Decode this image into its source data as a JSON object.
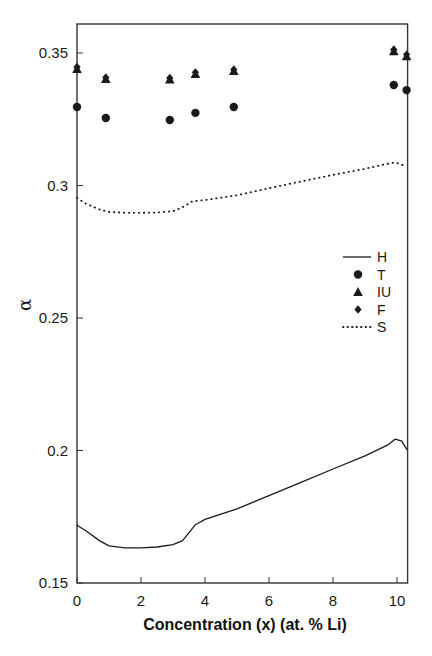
{
  "chart_data": {
    "type": "line",
    "title": "",
    "xlabel": "Concentration (x) (at. % Li)",
    "ylabel": "α",
    "xlim": [
      0,
      10.3
    ],
    "ylim": [
      0.15,
      0.36
    ],
    "xticks": [
      0,
      2,
      4,
      6,
      8,
      10
    ],
    "xtick_labels": [
      "0",
      "2",
      "4",
      "6",
      "8",
      "10"
    ],
    "yticks": [
      0.15,
      0.2,
      0.25,
      0.3,
      0.35
    ],
    "ytick_labels": [
      "0.15",
      "0.2",
      "0.25",
      "0.3",
      "0.35"
    ],
    "grid": false,
    "legend_position": "center-right",
    "series": [
      {
        "name": "H",
        "style": "solid-line",
        "x": [
          0,
          0.3,
          0.7,
          1.0,
          1.5,
          2.0,
          2.5,
          3.0,
          3.3,
          3.5,
          3.7,
          4.0,
          4.5,
          5.0,
          6.0,
          7.0,
          8.0,
          9.0,
          9.7,
          9.95,
          10.15,
          10.3
        ],
        "y": [
          0.1718,
          0.1695,
          0.166,
          0.164,
          0.1633,
          0.1633,
          0.1636,
          0.1645,
          0.166,
          0.169,
          0.172,
          0.174,
          0.176,
          0.178,
          0.183,
          0.188,
          0.193,
          0.198,
          0.202,
          0.2043,
          0.2035,
          0.2005
        ]
      },
      {
        "name": "T",
        "style": "circle-marker",
        "x": [
          0,
          0.9,
          2.9,
          3.7,
          4.9,
          9.9,
          10.3
        ],
        "y": [
          0.3296,
          0.3255,
          0.3247,
          0.3274,
          0.3296,
          0.3379,
          0.336
        ]
      },
      {
        "name": "IU",
        "style": "triangle-marker",
        "x": [
          0,
          0.9,
          2.9,
          3.7,
          4.9,
          9.9,
          10.3
        ],
        "y": [
          0.344,
          0.3402,
          0.34,
          0.3421,
          0.3432,
          0.3507,
          0.3488
        ]
      },
      {
        "name": "F",
        "style": "diamond-marker",
        "x": [
          0,
          0.9,
          2.9,
          3.7,
          4.9,
          9.9,
          10.3
        ],
        "y": [
          0.3447,
          0.3408,
          0.3406,
          0.3427,
          0.3438,
          0.3513,
          0.3494
        ]
      },
      {
        "name": "S",
        "style": "dotted-line",
        "x": [
          0,
          0.3,
          0.7,
          1.0,
          1.5,
          2.0,
          2.5,
          3.0,
          3.3,
          3.6,
          4.0,
          5.0,
          6.0,
          7.0,
          8.0,
          9.0,
          9.7,
          9.95,
          10.3
        ],
        "y": [
          0.2953,
          0.293,
          0.291,
          0.29,
          0.2897,
          0.2897,
          0.2898,
          0.2903,
          0.2918,
          0.294,
          0.2945,
          0.2963,
          0.299,
          0.3015,
          0.304,
          0.3063,
          0.3082,
          0.3087,
          0.3072
        ]
      }
    ]
  },
  "legend": {
    "items": [
      {
        "label": "H",
        "symbol": "line"
      },
      {
        "label": "T",
        "symbol": "circle"
      },
      {
        "label": "IU",
        "symbol": "triangle"
      },
      {
        "label": "F",
        "symbol": "diamond"
      },
      {
        "label": "S",
        "symbol": "dotted"
      }
    ]
  },
  "colors": {
    "ink": "#1a1a1a",
    "axis": "#333333",
    "background": "#ffffff"
  }
}
